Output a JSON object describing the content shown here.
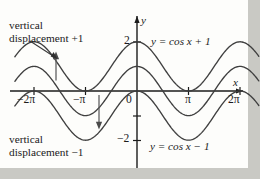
{
  "figure": {
    "background_color": "#c9c9c4",
    "plot_background_color": "#fdfdfb",
    "curve_color": "#3a3a3a",
    "axis_color": "#1b1b1b",
    "text_color": "#1b1b1b"
  },
  "annotations": {
    "top_note_line1": "vertical",
    "top_note_line2": "displacement +1",
    "bottom_note_line1": "vertical",
    "bottom_note_line2": "displacement −1",
    "equation_top": "y = cos x + 1",
    "equation_bottom": "y = cos x − 1"
  },
  "axes": {
    "x_axis_label": "x",
    "y_axis_label": "y",
    "origin_label": "0",
    "x_ticks": [
      {
        "label": "−2π",
        "value": -6.2832
      },
      {
        "label": "−π",
        "value": -3.1416
      },
      {
        "label": "π",
        "value": 3.1416
      },
      {
        "label": "2π",
        "value": 6.2832
      }
    ],
    "y_ticks": [
      {
        "label": "2",
        "value": 2
      },
      {
        "label": "−2",
        "value": -2
      }
    ],
    "xlim": [
      -7.4,
      7.4
    ],
    "ylim": [
      -2.9,
      2.6
    ]
  },
  "chart_data": {
    "type": "line",
    "title": "",
    "xlabel": "x",
    "ylabel": "y",
    "xlim": [
      -7.4,
      7.4
    ],
    "ylim": [
      -2.9,
      2.6
    ],
    "grid": false,
    "legend": "inline-labels",
    "xtick_labels": [
      "−2π",
      "−π",
      "0",
      "π",
      "2π"
    ],
    "xtick_values": [
      -6.2832,
      -3.1416,
      0,
      3.1416,
      6.2832
    ],
    "ytick_labels": [
      "2",
      "−2"
    ],
    "ytick_values": [
      2,
      -2
    ],
    "series": [
      {
        "name": "y = cos x + 1",
        "formula": "cos(x) + 1",
        "amplitude": 1,
        "vertical_shift": 1,
        "period": 6.2832,
        "maxima_y": 2,
        "minima_y": 0,
        "x": [
          -6.2832,
          -4.7124,
          -3.1416,
          -1.5708,
          0,
          1.5708,
          3.1416,
          4.7124,
          6.2832
        ],
        "values": [
          2,
          1,
          0,
          1,
          2,
          1,
          0,
          1,
          2
        ]
      },
      {
        "name": "y = cos x",
        "formula": "cos(x)",
        "amplitude": 1,
        "vertical_shift": 0,
        "period": 6.2832,
        "maxima_y": 1,
        "minima_y": -1,
        "x": [
          -6.2832,
          -4.7124,
          -3.1416,
          -1.5708,
          0,
          1.5708,
          3.1416,
          4.7124,
          6.2832
        ],
        "values": [
          1,
          0,
          -1,
          0,
          1,
          0,
          -1,
          0,
          1
        ]
      },
      {
        "name": "y = cos x − 1",
        "formula": "cos(x) - 1",
        "amplitude": 1,
        "vertical_shift": -1,
        "period": 6.2832,
        "maxima_y": 0,
        "minima_y": -2,
        "x": [
          -6.2832,
          -4.7124,
          -3.1416,
          -1.5708,
          0,
          1.5708,
          3.1416,
          4.7124,
          6.2832
        ],
        "values": [
          0,
          -1,
          -2,
          -1,
          0,
          -1,
          -2,
          -1,
          0
        ]
      }
    ],
    "arrows": [
      {
        "name": "up-arrow-plus-one",
        "direction": "up",
        "x": -5.0,
        "from_y": 0.0,
        "to_y": 1.0,
        "meaning": "vertical displacement +1"
      },
      {
        "name": "down-arrow-minus-one",
        "direction": "down",
        "x": -2.2,
        "from_y": -0.4,
        "to_y": -1.6,
        "meaning": "vertical displacement −1"
      }
    ]
  }
}
